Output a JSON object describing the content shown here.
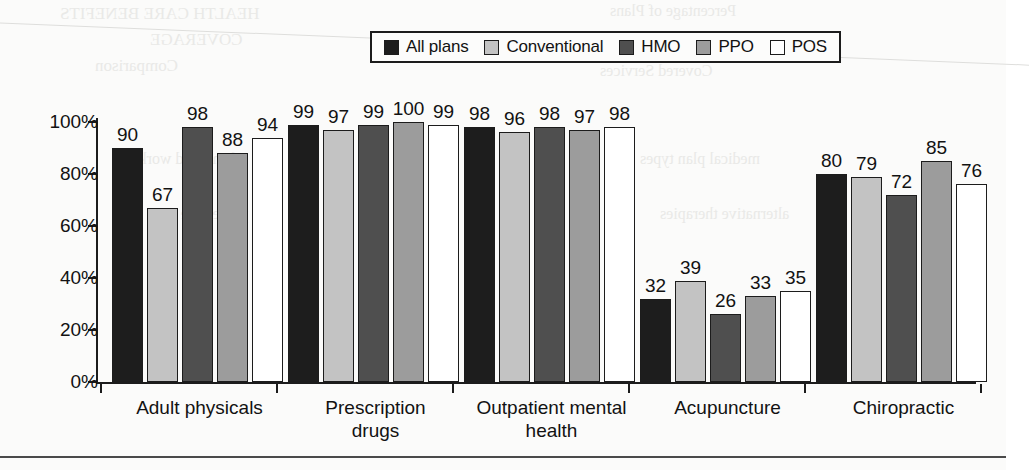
{
  "legend": {
    "items": [
      {
        "label": "All plans",
        "color": "#1d1d1d"
      },
      {
        "label": "Conventional",
        "color": "#c3c3c3"
      },
      {
        "label": "HMO",
        "color": "#4f4f4f"
      },
      {
        "label": "PPO",
        "color": "#9c9c9c"
      },
      {
        "label": "POS",
        "color": "#ffffff"
      }
    ]
  },
  "axis": {
    "y_ticks": [
      "0%",
      "20%",
      "40%",
      "60%",
      "80%",
      "100%"
    ]
  },
  "scan_artifacts": {
    "bleed_lines": [
      "HEALTH CARE BENEFITS",
      "COVERAGE",
      "Comparison",
      "Percentage of Plans",
      "Covered Services",
      "of enrolled workers",
      "medical plan types",
      "preventive care",
      "alternative therapies"
    ]
  },
  "chart_data": {
    "type": "bar",
    "title": "",
    "xlabel": "",
    "ylabel": "",
    "ylim": [
      0,
      100
    ],
    "grid": false,
    "legend_position": "top",
    "categories": [
      "Adult physicals",
      "Prescription\ndrugs",
      "Outpatient mental\nhealth",
      "Acupuncture",
      "Chiropractic"
    ],
    "series": [
      {
        "name": "All plans",
        "color": "#1d1d1d",
        "values": [
          90,
          99,
          98,
          32,
          80
        ]
      },
      {
        "name": "Conventional",
        "color": "#c3c3c3",
        "values": [
          67,
          97,
          96,
          39,
          79
        ]
      },
      {
        "name": "HMO",
        "color": "#4f4f4f",
        "values": [
          98,
          99,
          98,
          26,
          72
        ]
      },
      {
        "name": "PPO",
        "color": "#9c9c9c",
        "values": [
          88,
          100,
          97,
          33,
          85
        ]
      },
      {
        "name": "POS",
        "color": "#ffffff",
        "values": [
          94,
          99,
          98,
          35,
          76
        ]
      }
    ]
  }
}
